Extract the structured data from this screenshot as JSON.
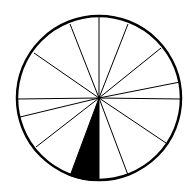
{
  "diagram": {
    "type": "divided-circle",
    "background": "#ffffff",
    "stroke_color": "#000000",
    "fill_color": "#000000",
    "center": [
      99,
      98
    ],
    "radius": 82,
    "spoke_endpoints": [
      [
        99,
        16
      ],
      [
        128,
        24
      ],
      [
        161,
        48
      ],
      [
        180,
        82
      ],
      [
        181,
        99
      ],
      [
        166,
        143
      ],
      [
        128,
        175
      ],
      [
        99,
        181
      ],
      [
        70,
        176
      ],
      [
        36,
        147
      ],
      [
        20,
        117
      ],
      [
        17,
        99
      ],
      [
        34,
        53
      ],
      [
        70,
        24
      ]
    ],
    "shaded_sector": {
      "from": [
        70,
        176
      ],
      "to": [
        99,
        181
      ]
    }
  }
}
